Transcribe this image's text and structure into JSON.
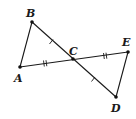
{
  "diagram": {
    "type": "geometry-figure",
    "points": [
      {
        "name": "A",
        "label": "A",
        "x": 20,
        "y": 67
      },
      {
        "name": "B",
        "label": "B",
        "x": 32,
        "y": 22
      },
      {
        "name": "C",
        "label": "C",
        "x": 73,
        "y": 59
      },
      {
        "name": "D",
        "label": "D",
        "x": 116,
        "y": 97
      },
      {
        "name": "E",
        "label": "E",
        "x": 128,
        "y": 52
      }
    ],
    "segments": [
      "AB",
      "BD",
      "AE",
      "ED"
    ],
    "congruence_marks": [
      {
        "segment": "BC",
        "marks": 1
      },
      {
        "segment": "CD",
        "marks": 1
      },
      {
        "segment": "AC",
        "marks": 2
      },
      {
        "segment": "CE",
        "marks": 2
      }
    ],
    "colors": {
      "ink": "#1a1a1a",
      "background": "#ffffff"
    }
  }
}
